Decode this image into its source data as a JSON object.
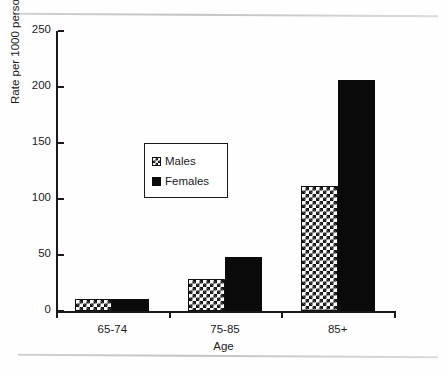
{
  "chart_data": {
    "type": "bar",
    "title": "",
    "subtitle": "",
    "xlabel": "Age",
    "ylabel": "Rate per 1000 persons",
    "categories": [
      "65-74",
      "75-85",
      "85+"
    ],
    "series": [
      {
        "name": "Males",
        "values": [
          11,
          29,
          112
        ],
        "fill": "checkerboard-hatch",
        "color": "#141414"
      },
      {
        "name": "Females",
        "values": [
          11,
          48,
          206
        ],
        "fill": "solid",
        "color": "#0a0a0a"
      }
    ],
    "ylim": [
      0,
      250
    ],
    "yticks": [
      0,
      50,
      100,
      150,
      200,
      250
    ],
    "ytick_labels": [
      "0",
      "50",
      "100",
      "150",
      "200",
      "250"
    ],
    "grid": false,
    "legend_position": "upper-left-inset",
    "legend_entries": [
      "Males",
      "Females"
    ]
  },
  "axes": {
    "y_title": "Rate per 1000 persons",
    "x_title": "Age"
  },
  "legend": {
    "items": [
      {
        "label": "Males"
      },
      {
        "label": "Females"
      }
    ]
  }
}
